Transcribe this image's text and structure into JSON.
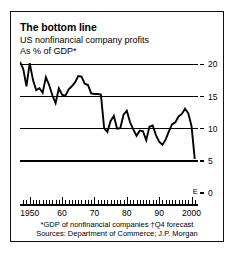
{
  "figure": {
    "title": "The bottom line",
    "subtitle_line1": "US nonfinancial company profits",
    "subtitle_line2": "As % of GDP*",
    "footnote_line1": "*GDP of nonfinancial companies   †Q4 forecast",
    "footnote_line2": "Sources: Department of Commerce; J.P. Morgan",
    "forecast_marker": "E",
    "line_color": "#000000",
    "grid_color": "#000000",
    "background": "#ffffff"
  },
  "chart_data": {
    "type": "line",
    "title": "The bottom line",
    "subtitle": "US nonfinancial company profits — As % of GDP*",
    "xlabel": "",
    "ylabel": "As % of GDP",
    "xlim": [
      1947,
      2002
    ],
    "ylim": [
      0,
      21
    ],
    "yticks": [
      0,
      5,
      10,
      15,
      20
    ],
    "ytick_labels": [
      "0",
      "5",
      "10",
      "15",
      "20"
    ],
    "xticks": [
      1950,
      1960,
      1970,
      1980,
      1990,
      2000
    ],
    "xtick_labels": [
      "1950",
      "60",
      "70",
      "80",
      "90",
      "2000"
    ],
    "minor_tick_interval": 1,
    "grid": true,
    "legend": false,
    "annotations": [
      {
        "text": "E",
        "x": 2001,
        "note": "Q4 forecast point"
      }
    ],
    "series": [
      {
        "name": "US nonfinancial company profits as % of GDP",
        "x": [
          1947,
          1948,
          1949,
          1950,
          1951,
          1952,
          1953,
          1954,
          1955,
          1956,
          1957,
          1958,
          1959,
          1960,
          1961,
          1962,
          1963,
          1964,
          1965,
          1966,
          1967,
          1968,
          1969,
          1970,
          1971,
          1972,
          1973,
          1974,
          1975,
          1976,
          1977,
          1978,
          1979,
          1980,
          1981,
          1982,
          1983,
          1984,
          1985,
          1986,
          1987,
          1988,
          1989,
          1990,
          1991,
          1992,
          1993,
          1994,
          1995,
          1996,
          1997,
          1998,
          1999,
          2000,
          2001
        ],
        "values": [
          20.4,
          19.3,
          16.6,
          20.2,
          17.6,
          16.0,
          16.3,
          15.6,
          18.0,
          16.8,
          15.2,
          14.0,
          16.3,
          15.3,
          15.1,
          16.1,
          16.6,
          17.2,
          18.2,
          18.1,
          17.0,
          16.8,
          15.5,
          15.4,
          15.4,
          15.3,
          10.1,
          9.5,
          11.2,
          12.0,
          10.0,
          10.1,
          12.2,
          12.8,
          11.0,
          9.9,
          8.9,
          9.7,
          9.6,
          8.2,
          10.3,
          10.5,
          9.0,
          8.0,
          7.5,
          8.3,
          9.6,
          10.7,
          11.0,
          11.9,
          12.3,
          13.1,
          12.4,
          10.4,
          5.3
        ]
      }
    ]
  }
}
